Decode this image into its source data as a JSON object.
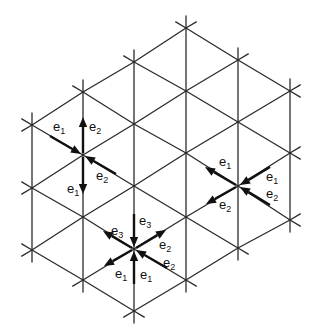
{
  "figure": {
    "line_color": "#2a2a2a",
    "arrow_color": "#111111"
  },
  "lattice": {
    "columns": [
      {
        "x": 32,
        "ys": [
          125,
          188,
          250
        ]
      },
      {
        "x": 83,
        "ys": [
          92,
          155,
          217,
          280
        ]
      },
      {
        "x": 134,
        "ys": [
          62,
          124,
          186,
          249,
          311
        ]
      },
      {
        "x": 186,
        "ys": [
          28,
          91,
          153,
          217,
          280
        ]
      },
      {
        "x": 238,
        "ys": [
          60,
          122,
          186,
          248
        ]
      },
      {
        "x": 290,
        "ys": [
          91,
          153,
          220
        ]
      }
    ]
  },
  "vertices": [
    {
      "id": "vertex-left",
      "x": 83,
      "y": 155,
      "arrows": [
        {
          "label": "e",
          "sub": "1",
          "from": [
            50,
            136
          ],
          "to": [
            81,
            154
          ],
          "lx": 53,
          "ly": 131
        },
        {
          "label": "e",
          "sub": "2",
          "from": [
            83,
            153
          ],
          "to": [
            83,
            117
          ],
          "lx": 89,
          "ly": 131
        },
        {
          "label": "e",
          "sub": "2",
          "from": [
            116,
            174
          ],
          "to": [
            85,
            156
          ],
          "lx": 96,
          "ly": 180
        },
        {
          "label": "e",
          "sub": "1",
          "from": [
            83,
            157
          ],
          "to": [
            83,
            194
          ],
          "lx": 67,
          "ly": 193
        }
      ]
    },
    {
      "id": "vertex-right",
      "x": 238,
      "y": 186,
      "arrows": [
        {
          "label": "e",
          "sub": "1",
          "from": [
            236,
            185
          ],
          "to": [
            205,
            167
          ],
          "lx": 219,
          "ly": 166
        },
        {
          "label": "e",
          "sub": "1",
          "from": [
            270,
            167
          ],
          "to": [
            240,
            185
          ],
          "lx": 266,
          "ly": 181
        },
        {
          "label": "e",
          "sub": "2",
          "from": [
            236,
            187
          ],
          "to": [
            206,
            204
          ],
          "lx": 219,
          "ly": 209
        },
        {
          "label": "e",
          "sub": "2",
          "from": [
            270,
            205
          ],
          "to": [
            240,
            187
          ],
          "lx": 266,
          "ly": 198
        }
      ]
    },
    {
      "id": "vertex-bottom",
      "x": 134,
      "y": 249,
      "arrows": [
        {
          "label": "e",
          "sub": "3",
          "from": [
            134,
            214
          ],
          "to": [
            134,
            247
          ],
          "lx": 139,
          "ly": 225
        },
        {
          "label": "e",
          "sub": "3",
          "from": [
            132,
            248
          ],
          "to": [
            103,
            231
          ],
          "lx": 111,
          "ly": 235
        },
        {
          "label": "e",
          "sub": "2",
          "from": [
            136,
            248
          ],
          "to": [
            166,
            230
          ],
          "lx": 159,
          "ly": 249
        },
        {
          "label": "e",
          "sub": "2",
          "from": [
            167,
            268
          ],
          "to": [
            136,
            250
          ],
          "lx": 163,
          "ly": 267
        },
        {
          "label": "e",
          "sub": "1",
          "from": [
            132,
            250
          ],
          "to": [
            104,
            266
          ],
          "lx": 115,
          "ly": 278
        },
        {
          "label": "e",
          "sub": "1",
          "from": [
            134,
            284
          ],
          "to": [
            134,
            251
          ],
          "lx": 140,
          "ly": 279
        }
      ]
    }
  ]
}
